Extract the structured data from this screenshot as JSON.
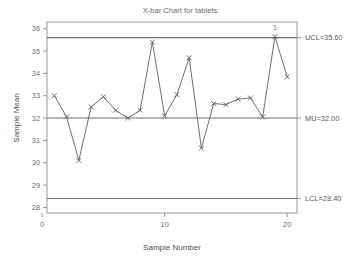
{
  "chart_data": {
    "type": "line",
    "title": "X-bar Chart for tablets",
    "xlabel": "Sample Number",
    "ylabel": "Sample Mean",
    "xlim": [
      0.4,
      20.8
    ],
    "ylim": [
      27.75,
      36.3
    ],
    "grid": false,
    "legend": "none",
    "x_ticks": [
      0,
      10,
      20
    ],
    "x_tick_labels": [
      "0",
      "10",
      "20"
    ],
    "y_ticks": [
      28,
      29,
      30,
      31,
      32,
      33,
      34,
      35,
      36
    ],
    "y_tick_labels": [
      "28",
      "29",
      "30",
      "31",
      "32",
      "33",
      "34",
      "35",
      "36"
    ],
    "x": [
      1,
      2,
      3,
      4,
      5,
      6,
      7,
      8,
      9,
      10,
      11,
      12,
      13,
      14,
      15,
      16,
      17,
      18,
      19,
      20
    ],
    "values": [
      33.0,
      32.05,
      30.1,
      32.5,
      32.95,
      32.35,
      32.0,
      32.35,
      35.4,
      32.1,
      33.05,
      34.7,
      30.65,
      32.65,
      32.6,
      32.85,
      32.9,
      32.05,
      35.65,
      33.85
    ],
    "series": [
      {
        "name": "Sample Mean",
        "values": [
          33.0,
          32.05,
          30.1,
          32.5,
          32.95,
          32.35,
          32.0,
          32.35,
          35.4,
          32.1,
          33.05,
          34.7,
          30.65,
          32.65,
          32.6,
          32.85,
          32.9,
          32.05,
          35.65,
          33.85
        ]
      }
    ],
    "control_limits": {
      "ucl": 35.6,
      "center": 32.0,
      "lcl": 28.4,
      "ucl_label": "UCL=35.60",
      "center_label": "MU=32.00",
      "lcl_label": "LCL=28.40"
    },
    "annotations": [
      {
        "label": "1",
        "x": 19,
        "y": 35.65
      }
    ],
    "colors": {
      "series": "#5d5d6b",
      "limits": "#6e6e6e",
      "frame": "#8c8c8c",
      "text": "#6b6b6b"
    }
  }
}
